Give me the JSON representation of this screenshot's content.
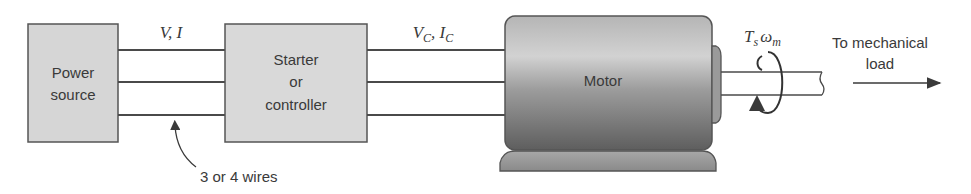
{
  "blocks": {
    "power_source": {
      "line1": "Power",
      "line2": "source"
    },
    "starter": {
      "line1": "Starter",
      "line2": "or",
      "line3": "controller"
    },
    "motor": {
      "label": "Motor"
    }
  },
  "signals": {
    "input": {
      "v": "V",
      "sep": ", ",
      "i": "I"
    },
    "controlled": {
      "v": "V",
      "v_sub": "C",
      "sep": ", ",
      "i": "I",
      "i_sub": "C"
    },
    "shaft": {
      "t": "T",
      "t_sub": "s",
      "w": "ω",
      "w_sub": "m"
    }
  },
  "annotations": {
    "wires": "3 or 4 wires",
    "load_line1": "To mechanical",
    "load_line2": "load"
  },
  "colors": {
    "block_fill": "#d9d9d9",
    "stroke": "#4a4a4a",
    "motor_top": "#c8c8c8",
    "motor_bottom": "#6e6e6e"
  }
}
